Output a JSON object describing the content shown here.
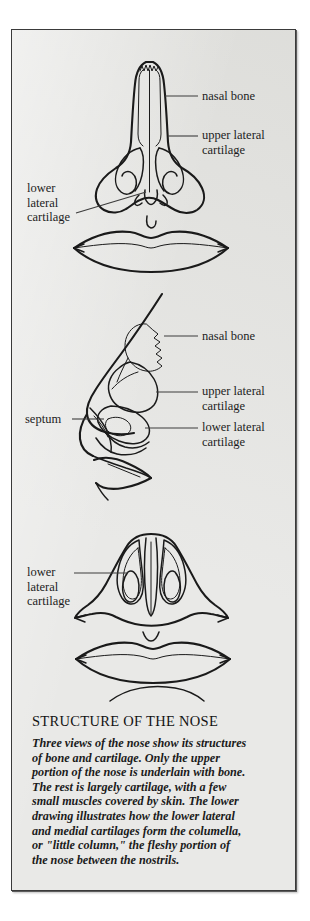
{
  "figure": {
    "title": "STRUCTURE OF THE NOSE",
    "caption": "Three views of the nose show its structures of bone and cartilage. Only the upper portion of the nose is underlain with bone. The rest is largely cartilage, with a few small muscles covered by skin. The lower drawing illustrates how the lower lateral and medial cartilages form the columella, or \"little column,\" the fleshy portion of the nose between the nostrils.",
    "background_color": "#e9e9e7",
    "ink_color": "#1a1a1a",
    "border_color": "#3a3a3a"
  },
  "views": [
    {
      "name": "frontal-view",
      "labels": [
        {
          "id": "nasal-bone",
          "text": "nasal bone",
          "side": "right"
        },
        {
          "id": "upper-lateral-cartilage",
          "text": "upper lateral\ncartilage",
          "side": "right"
        },
        {
          "id": "lower-lateral-cartilage",
          "text": "lower\nlateral\ncartilage",
          "side": "left"
        }
      ]
    },
    {
      "name": "profile-view",
      "labels": [
        {
          "id": "nasal-bone",
          "text": "nasal bone",
          "side": "right"
        },
        {
          "id": "upper-lateral-cartilage",
          "text": "upper lateral\ncartilage",
          "side": "right"
        },
        {
          "id": "lower-lateral-cartilage",
          "text": "lower lateral\ncartilage",
          "side": "right"
        },
        {
          "id": "septum",
          "text": "septum",
          "side": "left"
        }
      ]
    },
    {
      "name": "base-view",
      "labels": [
        {
          "id": "lower-lateral-cartilage",
          "text": "lower\nlateral\ncartilage",
          "side": "left"
        }
      ]
    }
  ]
}
